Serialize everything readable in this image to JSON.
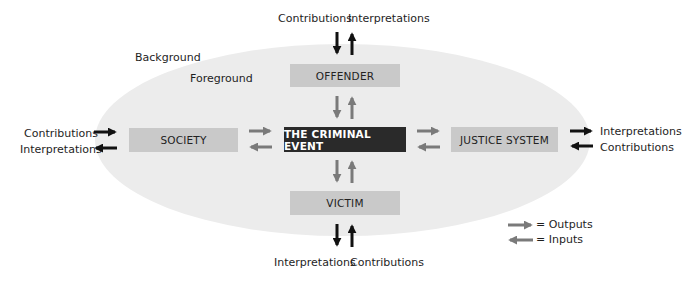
{
  "diagram": {
    "zones": {
      "background": "Background",
      "foreground": "Foreground"
    },
    "nodes": {
      "center": "THE CRIMINAL EVENT",
      "top": "OFFENDER",
      "bottom": "VICTIM",
      "left": "SOCIETY",
      "right": "JUSTICE SYSTEM"
    },
    "external_labels": {
      "top": {
        "left": "Contributions",
        "right": "Interpretations"
      },
      "bottom": {
        "left": "Interpretations",
        "right": "Contributions"
      },
      "left": {
        "top": "Contributions",
        "bottom": "Interpretations"
      },
      "right": {
        "top": "Interpretations",
        "bottom": "Contributions"
      }
    },
    "legend": {
      "outputs": "= Outputs",
      "inputs": "= Inputs"
    },
    "colors": {
      "ellipse": "#ececec",
      "node": "#c9c9c9",
      "center_node": "#2a2a2a",
      "inner_arrow": "#7a7a7a",
      "outer_arrow": "#111111"
    }
  }
}
